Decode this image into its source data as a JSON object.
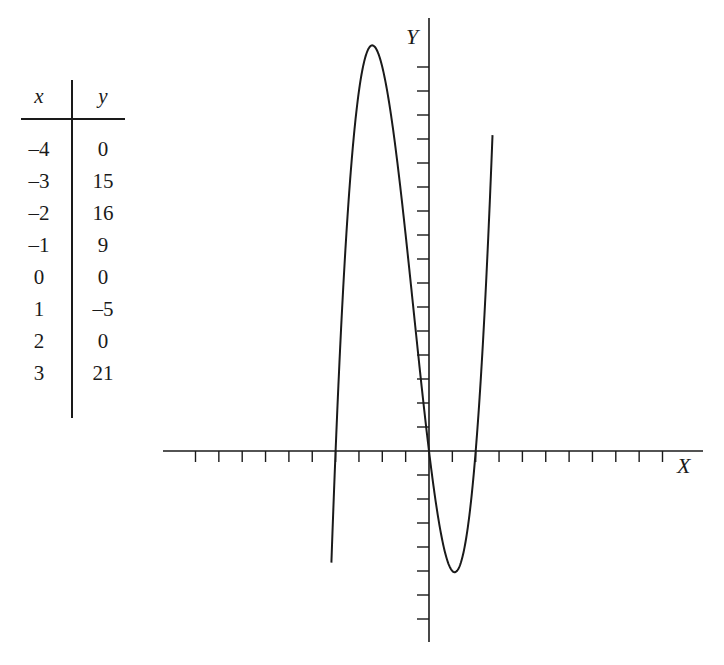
{
  "table": {
    "headers": [
      "x",
      "y"
    ],
    "rows": [
      [
        "–4",
        "0"
      ],
      [
        "–3",
        "15"
      ],
      [
        "–2",
        "16"
      ],
      [
        "–1",
        "9"
      ],
      [
        "0",
        "0"
      ],
      [
        "1",
        "–5"
      ],
      [
        "2",
        "0"
      ],
      [
        "3",
        "21"
      ]
    ]
  },
  "chart_data": {
    "type": "line",
    "title": "",
    "xlabel": "X",
    "ylabel": "Y",
    "function": "y = x^3 + 2x^2 - 8x",
    "x": [
      -4,
      -3,
      -2,
      -1,
      0,
      1,
      2,
      3
    ],
    "series": [
      {
        "name": "y",
        "values": [
          0,
          15,
          16,
          9,
          0,
          -5,
          0,
          21
        ]
      }
    ],
    "xlim": [
      -11,
      11
    ],
    "ylim": [
      -8,
      18
    ],
    "x_ticks": [
      -10,
      -9,
      -8,
      -7,
      -6,
      -5,
      -4,
      -3,
      -2,
      -1,
      1,
      2,
      3,
      4,
      5,
      6,
      7,
      8,
      9,
      10
    ],
    "y_ticks": [
      -7,
      -6,
      -5,
      -4,
      -3,
      -2,
      -1,
      1,
      2,
      3,
      4,
      5,
      6,
      7,
      8,
      9,
      10,
      11,
      12,
      13,
      14,
      15,
      16
    ],
    "tick_labels_shown": false,
    "grid": false,
    "legend": "none",
    "curve_x_range": [
      -4.18,
      2.72
    ],
    "line_color": "#1a1a1a"
  }
}
